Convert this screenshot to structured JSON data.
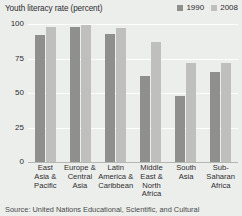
{
  "chart_data": {
    "type": "bar",
    "title": "Youth literacy rate (percent)",
    "xlabel": "",
    "ylabel": "",
    "ylim": [
      0,
      100
    ],
    "yticks": [
      100,
      75,
      50,
      25,
      0
    ],
    "grid": true,
    "legend_position": "top-right",
    "categories": [
      "East Asia & Pacific",
      "Europe & Central Asia",
      "Latin America & Caribbean",
      "Middle East & North Africa",
      "South Asia",
      "Sub-Saharan Africa"
    ],
    "category_lines": [
      [
        "East",
        "Asia &",
        "Pacific"
      ],
      [
        "Europe &",
        "Central",
        "Asia"
      ],
      [
        "Latin",
        "America &",
        "Caribbean"
      ],
      [
        "Middle",
        "East &",
        "North",
        "Africa"
      ],
      [
        "South",
        "Asia"
      ],
      [
        "Sub-",
        "Saharan",
        "Africa"
      ]
    ],
    "series": [
      {
        "name": "1990",
        "color": "#8f908d",
        "values": [
          92,
          98,
          93,
          62,
          48,
          65
        ]
      },
      {
        "name": "2008",
        "color": "#bfc0bd",
        "values": [
          98,
          99,
          97,
          87,
          72,
          72
        ]
      }
    ],
    "source": "Source: United Nations Educational, Scientific, and Cultural"
  },
  "colors": {
    "background": "#eceeec",
    "gridline": "#ffffff",
    "axis": "#b4b6b4",
    "text": "#2d2d2d"
  }
}
